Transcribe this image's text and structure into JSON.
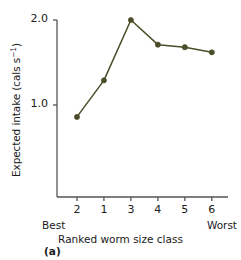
{
  "figure": {
    "panel_label": "(a)",
    "line_color": "#4a4d28",
    "axis_color": "#555555"
  },
  "chart_data": {
    "type": "line",
    "title": "",
    "xlabel": "Ranked worm size class",
    "ylabel": "Expected intake (cals s⁻¹)",
    "x_tick_labels": [
      "2",
      "1",
      "3",
      "4",
      "5",
      "6"
    ],
    "x_left_note": "Best",
    "x_right_note": "Worst",
    "y_tick_labels": [
      "1.0",
      "2.0"
    ],
    "y_tick_values": [
      1.0,
      2.0
    ],
    "ylim": [
      0,
      2.08
    ],
    "xlim": [
      0.5,
      6.5
    ],
    "grid": false,
    "legend": "none",
    "marker": "filled-circle",
    "series": [
      {
        "name": "Expected intake",
        "categories": [
          "2",
          "1",
          "3",
          "4",
          "5",
          "6"
        ],
        "values": [
          0.86,
          1.29,
          2.0,
          1.71,
          1.68,
          1.62
        ]
      }
    ]
  }
}
